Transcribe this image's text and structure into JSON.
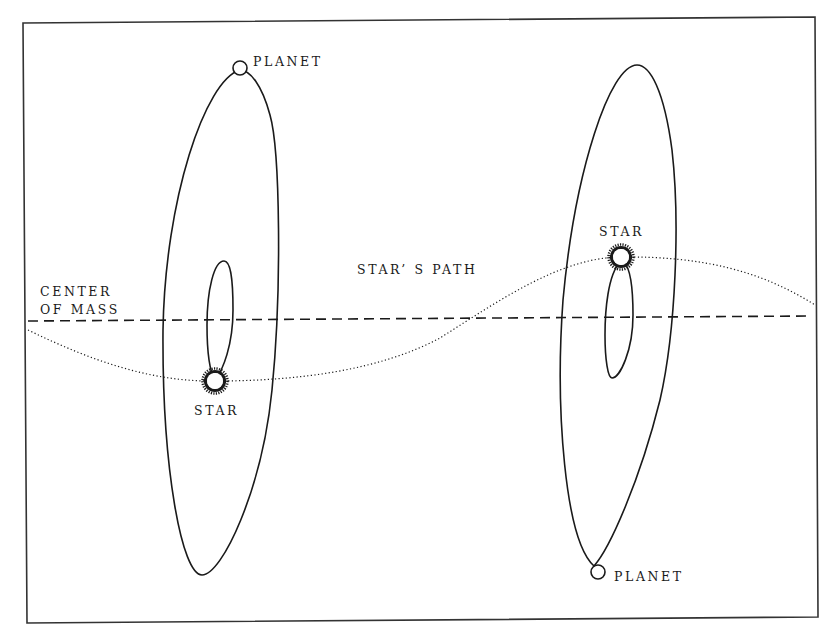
{
  "diagram": {
    "type": "star-planet barycentric orbit illustration",
    "colors": {
      "background": "#ffffff",
      "ink": "#1a1a1a",
      "frame": "#333333"
    },
    "labels": {
      "center_of_mass_line1": "CENTER",
      "center_of_mass_line2": "OF MASS",
      "stars_path": "STAR’ S PATH",
      "left_planet": "PLANET",
      "left_star": "STAR",
      "right_star": "STAR",
      "right_planet": "PLANET"
    },
    "elements": {
      "center_of_mass_line": "dashed-horizontal-line",
      "stars_path_curve": "dotted-sinusoid",
      "left_system": {
        "planet_icon": "open-circle",
        "star_icon": "sun-burst",
        "planet_orbit": "large-ellipse",
        "star_orbit": "small-ellipse"
      },
      "right_system": {
        "planet_icon": "open-circle",
        "star_icon": "sun-burst",
        "planet_orbit": "large-ellipse",
        "star_orbit": "small-ellipse"
      }
    }
  }
}
